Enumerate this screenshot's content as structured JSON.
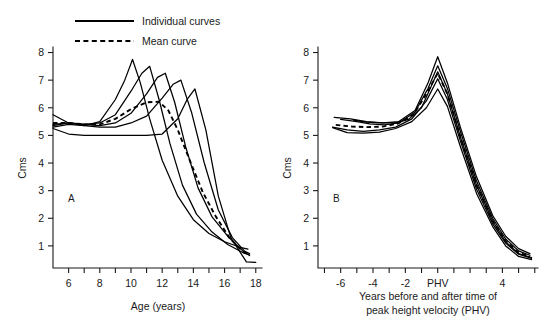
{
  "figure": {
    "background": "#ffffff",
    "ink": "#000000"
  },
  "legend": {
    "position": "top-left",
    "items": [
      {
        "label": "Individual curves",
        "style": "solid",
        "sample": "solid-line-icon"
      },
      {
        "label": "Mean curve",
        "style": "dashed",
        "sample": "dashed-line-icon"
      }
    ]
  },
  "chart_data": [
    {
      "type": "line",
      "panel": "A",
      "panel_label": "A",
      "title": "",
      "xlabel": "Age (years)",
      "ylabel": "Cms",
      "xlim": [
        5,
        18.4
      ],
      "ylim": [
        0.2,
        8.2
      ],
      "grid": false,
      "legend_position": "top-left",
      "xticks": [
        6,
        7,
        8,
        9,
        10,
        11,
        12,
        13,
        14,
        15,
        16,
        17,
        18
      ],
      "xtick_labels": [
        "6",
        "",
        "8",
        "",
        "10",
        "",
        "12",
        "",
        "14",
        "",
        "16",
        "",
        "18"
      ],
      "yticks": [
        1,
        2,
        3,
        4,
        5,
        6,
        7,
        8
      ],
      "ytick_labels": [
        "1",
        "2",
        "3",
        "4",
        "5",
        "6",
        "7",
        "8"
      ],
      "series": [
        {
          "name": "Individual curve 1 (earliest maturer)",
          "style": "solid",
          "x": [
            5.0,
            6.0,
            7.0,
            8.0,
            9.0,
            9.6,
            10.1,
            10.6,
            11.2,
            12.0,
            13.0,
            14.0,
            15.0,
            16.0,
            17.0,
            17.5
          ],
          "y": [
            5.75,
            5.45,
            5.35,
            5.5,
            6.3,
            7.0,
            7.75,
            6.9,
            5.6,
            4.1,
            2.8,
            1.95,
            1.45,
            1.15,
            0.95,
            0.88
          ]
        },
        {
          "name": "Individual curve 2",
          "style": "solid",
          "x": [
            5.0,
            6.0,
            7.0,
            8.0,
            9.0,
            10.0,
            10.7,
            11.2,
            11.8,
            12.5,
            13.3,
            14.2,
            15.2,
            16.2,
            17.2,
            17.6
          ],
          "y": [
            5.4,
            5.45,
            5.4,
            5.45,
            5.75,
            6.6,
            7.25,
            7.5,
            6.3,
            4.7,
            3.2,
            2.15,
            1.5,
            1.05,
            0.75,
            0.68
          ]
        },
        {
          "name": "Individual curve 3",
          "style": "solid",
          "x": [
            5.0,
            6.0,
            7.0,
            8.0,
            9.0,
            10.0,
            11.0,
            11.7,
            12.2,
            12.8,
            13.5,
            14.3,
            15.2,
            16.2,
            17.2,
            17.6
          ],
          "y": [
            5.35,
            5.45,
            5.4,
            5.35,
            5.45,
            5.8,
            6.5,
            7.1,
            7.25,
            6.2,
            4.6,
            3.1,
            2.05,
            1.35,
            0.8,
            0.65
          ]
        },
        {
          "name": "Individual curve 4",
          "style": "solid",
          "x": [
            5.0,
            6.0,
            7.0,
            8.0,
            9.0,
            10.0,
            11.0,
            12.0,
            12.7,
            13.2,
            13.9,
            14.7,
            15.6,
            16.5,
            17.3,
            17.6
          ],
          "y": [
            5.3,
            5.4,
            5.35,
            5.3,
            5.3,
            5.45,
            5.7,
            6.35,
            6.85,
            7.0,
            5.8,
            4.0,
            2.3,
            1.3,
            0.8,
            0.72
          ]
        },
        {
          "name": "Individual curve 5 (latest maturer)",
          "style": "solid",
          "x": [
            5.0,
            6.0,
            7.0,
            8.0,
            9.0,
            10.0,
            11.0,
            12.0,
            13.0,
            13.6,
            14.1,
            14.8,
            15.6,
            16.4,
            17.4,
            18.0
          ],
          "y": [
            5.25,
            5.05,
            5.0,
            5.0,
            5.0,
            5.0,
            5.0,
            5.05,
            5.6,
            6.3,
            6.68,
            5.2,
            2.8,
            1.3,
            0.42,
            0.4
          ]
        },
        {
          "name": "Mean curve",
          "style": "dashed",
          "x": [
            5.0,
            6.0,
            7.0,
            8.0,
            9.0,
            10.0,
            11.0,
            11.8,
            12.4,
            13.0,
            13.8,
            14.6,
            15.4,
            16.3,
            17.2,
            17.6
          ],
          "y": [
            5.45,
            5.45,
            5.4,
            5.4,
            5.6,
            5.95,
            6.2,
            6.22,
            5.9,
            5.2,
            4.05,
            2.95,
            2.1,
            1.3,
            0.78,
            0.68
          ]
        }
      ]
    },
    {
      "type": "line",
      "panel": "B",
      "panel_label": "B",
      "title": "",
      "xlabel": "Years before and after time of peak height velocity (PHV)",
      "xlabel_line1": "Years before and after time of",
      "xlabel_line2": "peak height velocity (PHV)",
      "ylabel": "Cms",
      "xlim": [
        -7.4,
        6.2
      ],
      "ylim": [
        0.2,
        8.2
      ],
      "grid": false,
      "legend_position": "none",
      "xticks": [
        -7,
        -6,
        -5,
        -4,
        -3,
        -2,
        -1,
        0,
        1,
        2,
        3,
        4,
        5,
        6
      ],
      "xtick_labels": [
        "",
        "-6",
        "",
        "-4",
        "",
        "-2",
        "",
        "PHV",
        "",
        "",
        "",
        "4",
        "",
        ""
      ],
      "yticks": [
        1,
        2,
        3,
        4,
        5,
        6,
        7,
        8
      ],
      "ytick_labels": [
        "1",
        "2",
        "3",
        "4",
        "5",
        "6",
        "7",
        "8"
      ],
      "series": [
        {
          "name": "Individual curve 1 (aligned)",
          "style": "solid",
          "x": [
            -6.4,
            -5.4,
            -4.4,
            -3.4,
            -2.4,
            -1.4,
            -0.6,
            0.0,
            0.6,
            1.4,
            2.4,
            3.4,
            4.2,
            5.0,
            5.7
          ],
          "y": [
            5.65,
            5.6,
            5.5,
            5.45,
            5.5,
            5.9,
            6.9,
            7.85,
            6.9,
            5.3,
            3.5,
            2.1,
            1.35,
            0.9,
            0.72
          ]
        },
        {
          "name": "Individual curve 2 (aligned)",
          "style": "solid",
          "x": [
            -6.0,
            -5.0,
            -4.2,
            -3.3,
            -2.4,
            -1.4,
            -0.6,
            0.0,
            0.6,
            1.4,
            2.4,
            3.4,
            4.2,
            5.0,
            5.7
          ],
          "y": [
            5.58,
            5.5,
            5.42,
            5.38,
            5.45,
            5.85,
            6.7,
            7.52,
            6.7,
            5.15,
            3.35,
            2.0,
            1.25,
            0.82,
            0.66
          ]
        },
        {
          "name": "Individual curve 3 (aligned)",
          "style": "solid",
          "x": [
            -5.2,
            -4.4,
            -3.5,
            -2.6,
            -1.8,
            -1.0,
            -0.5,
            0.0,
            0.6,
            1.4,
            2.4,
            3.4,
            4.2,
            5.0,
            5.8
          ],
          "y": [
            5.55,
            5.48,
            5.45,
            5.45,
            5.58,
            6.0,
            6.65,
            7.3,
            6.5,
            4.95,
            3.2,
            1.9,
            1.15,
            0.72,
            0.58
          ]
        },
        {
          "name": "Individual curve 4 (aligned)",
          "style": "solid",
          "x": [
            -6.5,
            -5.6,
            -4.6,
            -3.6,
            -2.6,
            -1.6,
            -0.7,
            0.0,
            0.6,
            1.4,
            2.4,
            3.4,
            4.2,
            5.0,
            5.8
          ],
          "y": [
            5.3,
            5.2,
            5.15,
            5.2,
            5.3,
            5.6,
            6.25,
            7.05,
            6.3,
            4.8,
            3.05,
            1.8,
            1.1,
            0.7,
            0.55
          ]
        },
        {
          "name": "Individual curve 5 (aligned)",
          "style": "solid",
          "x": [
            -6.5,
            -5.6,
            -4.6,
            -3.6,
            -2.6,
            -1.6,
            -0.7,
            0.0,
            0.6,
            1.4,
            2.4,
            3.4,
            4.2,
            5.0,
            5.8
          ],
          "y": [
            5.28,
            5.1,
            5.08,
            5.12,
            5.25,
            5.5,
            6.0,
            6.68,
            6.05,
            4.6,
            2.9,
            1.7,
            1.0,
            0.62,
            0.5
          ]
        },
        {
          "name": "Mean curve",
          "style": "dashed",
          "x": [
            -6.3,
            -5.3,
            -4.4,
            -3.4,
            -2.5,
            -1.5,
            -0.7,
            0.0,
            0.6,
            1.4,
            2.4,
            3.4,
            4.2,
            5.0,
            5.7
          ],
          "y": [
            5.38,
            5.32,
            5.3,
            5.32,
            5.42,
            5.75,
            6.5,
            7.25,
            6.5,
            4.95,
            3.2,
            1.9,
            1.18,
            0.76,
            0.62
          ]
        }
      ]
    }
  ]
}
